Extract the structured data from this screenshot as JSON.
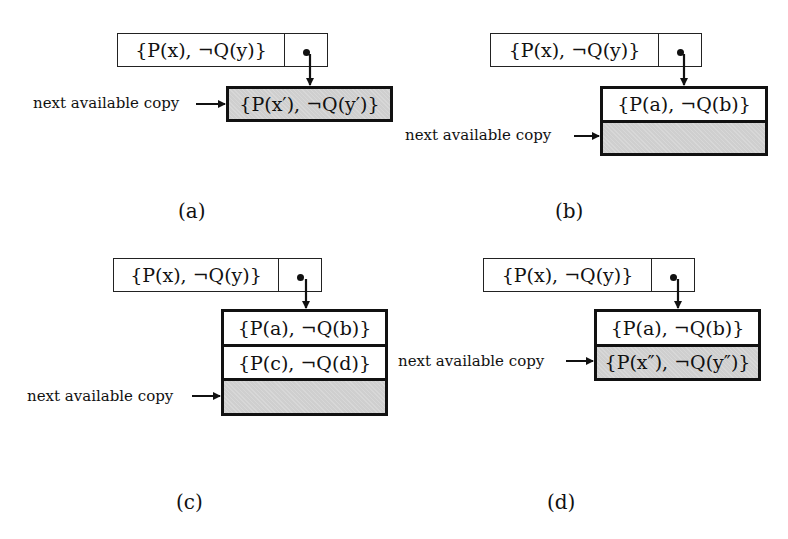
{
  "figure": {
    "panels": [
      {
        "id": "a",
        "caption": "(a)",
        "pointer_clause": "{P(x), ¬Q(y)}",
        "stack_rows": [
          {
            "text": "{P(x′), ¬Q(y′)}",
            "shaded": true
          }
        ],
        "pointer_label": "next available copy",
        "points_to_row": 0
      },
      {
        "id": "b",
        "caption": "(b)",
        "pointer_clause": "{P(x), ¬Q(y)}",
        "stack_rows": [
          {
            "text": "{P(a), ¬Q(b)}",
            "shaded": false
          },
          {
            "text": "",
            "shaded": true
          }
        ],
        "pointer_label": "next available copy",
        "points_to_row": 1
      },
      {
        "id": "c",
        "caption": "(c)",
        "pointer_clause": "{P(x), ¬Q(y)}",
        "stack_rows": [
          {
            "text": "{P(a), ¬Q(b)}",
            "shaded": false
          },
          {
            "text": "{P(c), ¬Q(d)}",
            "shaded": false
          },
          {
            "text": "",
            "shaded": true
          }
        ],
        "pointer_label": "next available copy",
        "points_to_row": 2
      },
      {
        "id": "d",
        "caption": "(d)",
        "pointer_clause": "{P(x), ¬Q(y)}",
        "stack_rows": [
          {
            "text": "{P(a), ¬Q(b)}",
            "shaded": false
          },
          {
            "text": "{P(x″), ¬Q(y″)}",
            "shaded": true
          }
        ],
        "pointer_label": "next available copy",
        "points_to_row": 1
      }
    ],
    "colors": {
      "line": "#111111",
      "shade": "#cfcfcf",
      "background": "#ffffff"
    }
  }
}
